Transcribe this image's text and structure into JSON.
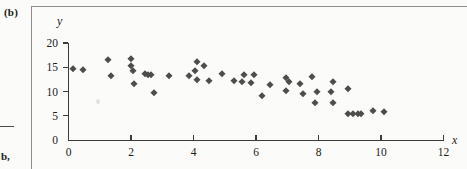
{
  "panel": {
    "label": "(b)",
    "margin_note": "b,"
  },
  "chart_data": {
    "type": "scatter",
    "title": "",
    "xlabel": "x",
    "ylabel": "y",
    "xlim": [
      0,
      12
    ],
    "ylim": [
      0,
      20
    ],
    "xticks": [
      0,
      2,
      4,
      6,
      8,
      10,
      12
    ],
    "yticks": [
      0,
      5,
      10,
      15,
      20
    ],
    "xtick_labels": [
      "0",
      "2",
      "4",
      "6",
      "8",
      "10",
      "12"
    ],
    "ytick_labels": [
      "0",
      "5",
      "10",
      "15",
      "20"
    ],
    "grid": false,
    "legend": null,
    "marker": "diamond",
    "marker_color": "#4d4d4d",
    "points": [
      [
        0.15,
        14.6
      ],
      [
        0.45,
        14.5
      ],
      [
        1.25,
        16.5
      ],
      [
        1.35,
        13.1
      ],
      [
        2.0,
        16.7
      ],
      [
        2.0,
        15.2
      ],
      [
        2.05,
        14.3
      ],
      [
        2.1,
        11.6
      ],
      [
        2.45,
        13.7
      ],
      [
        2.55,
        13.5
      ],
      [
        2.65,
        13.3
      ],
      [
        2.75,
        9.6
      ],
      [
        3.2,
        13.1
      ],
      [
        3.85,
        13.1
      ],
      [
        4.1,
        16.1
      ],
      [
        4.05,
        14.3
      ],
      [
        4.35,
        15.3
      ],
      [
        4.1,
        12.3
      ],
      [
        4.5,
        12.2
      ],
      [
        4.9,
        13.7
      ],
      [
        5.3,
        12.1
      ],
      [
        5.55,
        11.9
      ],
      [
        5.6,
        13.5
      ],
      [
        5.95,
        13.4
      ],
      [
        5.85,
        11.8
      ],
      [
        6.2,
        9.1
      ],
      [
        6.45,
        11.3
      ],
      [
        6.95,
        12.8
      ],
      [
        7.05,
        12.0
      ],
      [
        6.95,
        10.2
      ],
      [
        7.4,
        11.5
      ],
      [
        7.5,
        9.4
      ],
      [
        7.8,
        13.0
      ],
      [
        7.95,
        10.0
      ],
      [
        7.9,
        7.7
      ],
      [
        8.45,
        11.9
      ],
      [
        8.4,
        9.9
      ],
      [
        8.45,
        7.6
      ],
      [
        8.95,
        10.6
      ],
      [
        8.95,
        5.4
      ],
      [
        9.1,
        5.3
      ],
      [
        9.25,
        5.3
      ],
      [
        9.35,
        5.4
      ],
      [
        9.75,
        6.0
      ],
      [
        10.1,
        5.7
      ]
    ]
  }
}
